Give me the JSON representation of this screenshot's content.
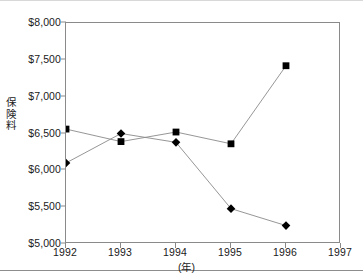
{
  "chart_data": {
    "type": "line",
    "title": "",
    "subtitle": "",
    "xlabel": "(年)",
    "ylabel": "保険料",
    "x": [
      1992,
      1993,
      1994,
      1995,
      1996
    ],
    "xlim": [
      1992,
      1997
    ],
    "ylim": [
      5000,
      8000
    ],
    "grid": false,
    "legend": "none",
    "x_tick_labels": [
      "1992",
      "1993",
      "1994",
      "1995",
      "1996",
      "1997"
    ],
    "x_tick_values": [
      1992,
      1993,
      1994,
      1995,
      1996,
      1997
    ],
    "y_tick_labels": [
      "$5,000",
      "$5,500",
      "$6,000",
      "$6,500",
      "$7,000",
      "$7,500",
      "$8,000"
    ],
    "y_tick_values": [
      5000,
      5500,
      6000,
      6500,
      7000,
      7500,
      8000
    ],
    "series": [
      {
        "name": "series-square",
        "marker": "square",
        "values": [
          6560,
          6390,
          6520,
          6360,
          7420
        ]
      },
      {
        "name": "series-diamond",
        "marker": "diamond",
        "values": [
          6100,
          6500,
          6380,
          5480,
          5250
        ]
      }
    ],
    "colors": {
      "marker": "#000000",
      "line": "#8a8a8a",
      "axis": "#8a8a8a",
      "text": "#1a1a1a",
      "background": "#ffffff"
    }
  }
}
